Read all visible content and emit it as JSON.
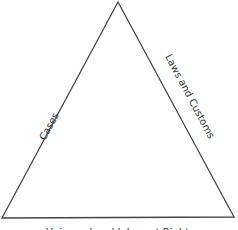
{
  "diagram": {
    "shape": "triangle",
    "stroke_color": "#444444",
    "labels": {
      "left_side": "Cases",
      "right_side": "Laws and Customs",
      "bottom": "Universal and Inherent Rights"
    }
  }
}
